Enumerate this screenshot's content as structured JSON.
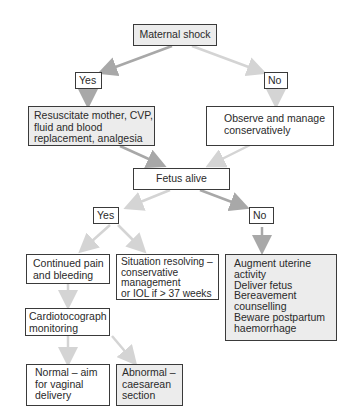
{
  "diagram": {
    "root": {
      "label": "Maternal shock"
    },
    "branch1": {
      "yes_label": "Yes",
      "no_label": "No",
      "yes_action": [
        "Resuscitate mother, CVP,",
        "fluid and blood",
        "replacement, analgesia"
      ],
      "no_action": [
        "Observe and manage",
        "conservatively"
      ]
    },
    "fetus_node": {
      "label": "Fetus alive"
    },
    "branch2": {
      "yes_label": "Yes",
      "no_label": "No",
      "yes_options": {
        "continued": [
          "Continued pain",
          "and bleeding"
        ],
        "resolving": [
          "Situation resolving –",
          "conservative",
          "management",
          "or IOL if > 37 weeks"
        ]
      },
      "no_action": [
        "Augment uterine",
        "activity",
        "Deliver fetus",
        "Bereavement",
        "counselling",
        "Beware postpartum",
        "haemorrhage"
      ]
    },
    "ctg_node": {
      "lines": [
        "Cardiotocograph",
        "monitoring"
      ]
    },
    "outcomes": {
      "normal": [
        "Normal – aim",
        "for vaginal",
        "delivery"
      ],
      "abnormal": [
        "Abnormal –",
        "caesarean",
        "section"
      ]
    },
    "colors": {
      "box_border": "#3a3a3a",
      "shaded_fill": "#ececec",
      "arrow_dark": "#a8a8a8",
      "arrow_light": "#d4d4d4"
    }
  }
}
